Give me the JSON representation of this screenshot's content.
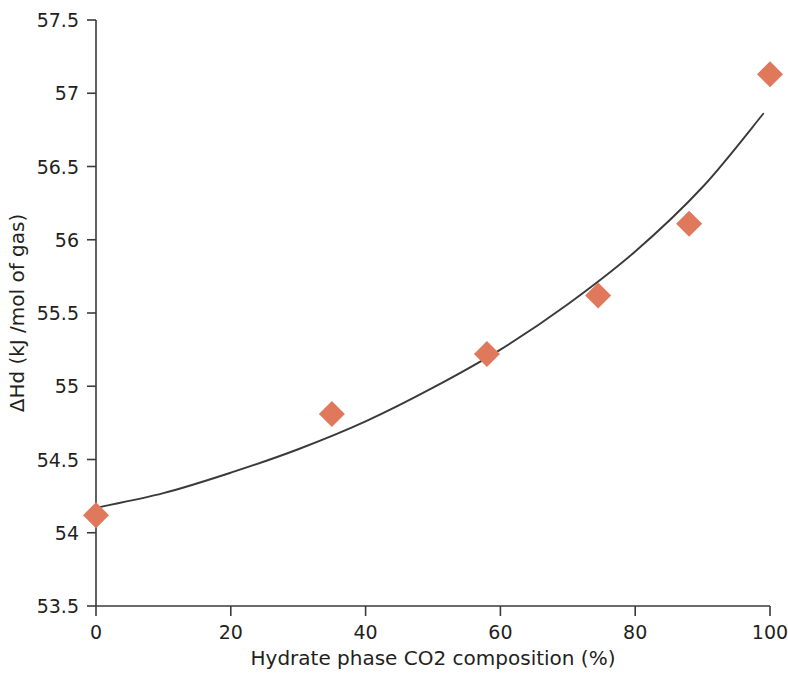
{
  "chart_data": {
    "type": "scatter",
    "title": "",
    "subtitle": "",
    "xlabel": "Hydrate phase CO2 composition (%)",
    "ylabel": "ΔHd (kJ /mol of gas)",
    "xlim": [
      0,
      100
    ],
    "ylim": [
      53.5,
      57.5
    ],
    "xticks": [
      0,
      20,
      40,
      60,
      80,
      100
    ],
    "xtick_labels": [
      "0",
      "20",
      "40",
      "60",
      "80",
      "100"
    ],
    "yticks": [
      53.5,
      54,
      54.5,
      55,
      55.5,
      56,
      56.5,
      57,
      57.5
    ],
    "ytick_labels": [
      "53.5",
      "54",
      "54.5",
      "55",
      "55.5",
      "56",
      "56.5",
      "57",
      "57.5"
    ],
    "grid": false,
    "legend": null,
    "marker_shape": "diamond",
    "marker_color": "#e0785c",
    "marker_size": 13,
    "line_color": "#3a3a3a",
    "series": [
      {
        "name": "ΔHd data",
        "marker": "diamond",
        "color": "#e0785c",
        "x": [
          0,
          35,
          58,
          74.5,
          88,
          100
        ],
        "y": [
          54.12,
          54.81,
          55.22,
          55.62,
          56.11,
          57.13
        ]
      },
      {
        "name": "fitted trend curve",
        "type": "line",
        "color": "#3a3a3a",
        "x": [
          0,
          10,
          20,
          30,
          40,
          50,
          60,
          70,
          80,
          90,
          99
        ],
        "y": [
          54.17,
          54.27,
          54.41,
          54.57,
          54.76,
          54.99,
          55.25,
          55.56,
          55.92,
          56.36,
          56.86
        ]
      }
    ]
  },
  "axis": {
    "x_title": "Hydrate phase CO2 composition (%)",
    "y_title": "ΔHd (kJ /mol of gas)"
  }
}
